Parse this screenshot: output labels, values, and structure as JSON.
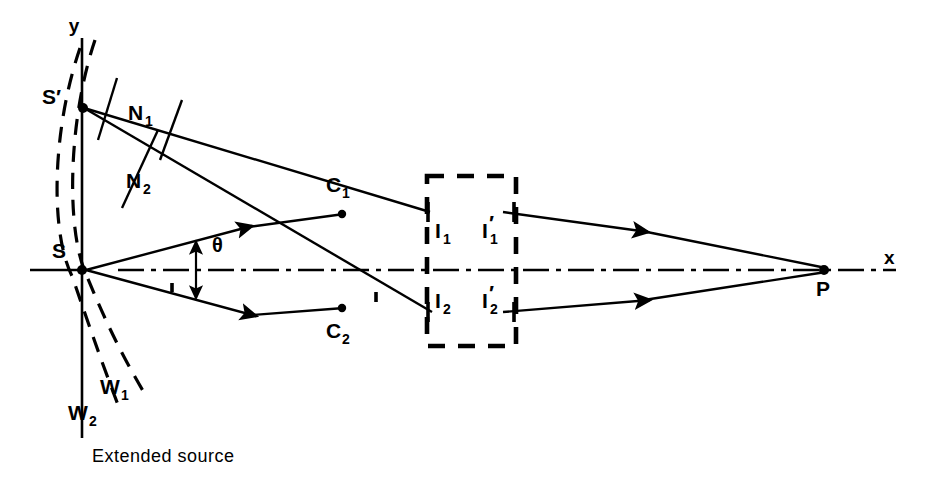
{
  "figure": {
    "caption": "Extended source",
    "type": "optical-ray-diagram",
    "background_color": "#ffffff",
    "line_color": "#000000"
  },
  "axes": {
    "x_label": "x",
    "y_label": "y",
    "x_axis": {
      "x1": 30,
      "y1": 270,
      "x2": 210,
      "y2": 270
    },
    "y_axis": {
      "x1": 82,
      "y1": 38,
      "x2": 82,
      "y2": 438
    },
    "optical_axis_style": "dash-dot"
  },
  "points": {
    "source_primary": {
      "label": "S",
      "x": 82,
      "y": 270
    },
    "source_secondary": {
      "label": "S′",
      "x": 82,
      "y": 108
    },
    "crossing_upper": {
      "label": "C",
      "sub": "1",
      "x": 342,
      "y": 214
    },
    "crossing_lower": {
      "label": "C",
      "sub": "2",
      "x": 342,
      "y": 308
    },
    "image_upper_in": {
      "label": "I",
      "sub": "1",
      "x": 434,
      "y": 212
    },
    "image_lower_in": {
      "label": "I",
      "sub": "2",
      "x": 434,
      "y": 312
    },
    "image_upper_out": {
      "label": "I",
      "sub": "1",
      "prime": "′",
      "x": 505,
      "y": 212
    },
    "image_lower_out": {
      "label": "I",
      "sub": "2",
      "prime": "′",
      "x": 505,
      "y": 312
    },
    "convergence": {
      "label": "P",
      "x": 824,
      "y": 270
    }
  },
  "normals": [
    {
      "label": "N",
      "sub": "1",
      "text_x": 140,
      "text_y": 112
    },
    {
      "label": "N",
      "sub": "2",
      "text_x": 140,
      "text_y": 180
    }
  ],
  "wavefronts": [
    {
      "label": "W",
      "sub": "1",
      "text_x": 112,
      "text_y": 387
    },
    {
      "label": "W",
      "sub": "2",
      "text_x": 78,
      "text_y": 412
    }
  ],
  "angle": {
    "symbol": "θ",
    "text_x": 216,
    "text_y": 250,
    "marker_x": 196,
    "marker_top_y": 242,
    "marker_bottom_y": 298
  },
  "box": {
    "name": "optical-system-region",
    "x": 427,
    "y": 176,
    "width": 89,
    "height": 170,
    "style": "dashed"
  }
}
